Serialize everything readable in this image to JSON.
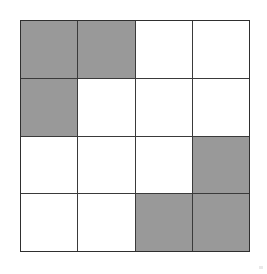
{
  "figure": {
    "rows": 4,
    "columns": 4,
    "fill_color": "#999999",
    "empty_color": "#ffffff",
    "line_color": "#3a3a3a",
    "background_color": "#ffffff"
  },
  "chart_data": {
    "type": "heatmap",
    "xlabel": "",
    "ylabel": "",
    "categories": [
      "1",
      "2",
      "3",
      "4"
    ],
    "row_labels": [
      "1",
      "2",
      "3",
      "4"
    ],
    "legend": [
      {
        "label": "shaded",
        "value": 1,
        "color": "#999999"
      },
      {
        "label": "empty",
        "value": 0,
        "color": "#ffffff"
      }
    ],
    "values": [
      [
        1,
        1,
        0,
        0
      ],
      [
        1,
        0,
        0,
        0
      ],
      [
        0,
        0,
        0,
        1
      ],
      [
        0,
        0,
        1,
        1
      ]
    ],
    "shaded_count": 7,
    "empty_count": 9,
    "grid": true
  },
  "cells": [
    {
      "id": "cell-r1c1",
      "row": 1,
      "col": 1,
      "state": "shaded"
    },
    {
      "id": "cell-r1c2",
      "row": 1,
      "col": 2,
      "state": "shaded"
    },
    {
      "id": "cell-r1c3",
      "row": 1,
      "col": 3,
      "state": "empty"
    },
    {
      "id": "cell-r1c4",
      "row": 1,
      "col": 4,
      "state": "empty"
    },
    {
      "id": "cell-r2c1",
      "row": 2,
      "col": 1,
      "state": "shaded"
    },
    {
      "id": "cell-r2c2",
      "row": 2,
      "col": 2,
      "state": "empty"
    },
    {
      "id": "cell-r2c3",
      "row": 2,
      "col": 3,
      "state": "empty"
    },
    {
      "id": "cell-r2c4",
      "row": 2,
      "col": 4,
      "state": "empty"
    },
    {
      "id": "cell-r3c1",
      "row": 3,
      "col": 1,
      "state": "empty"
    },
    {
      "id": "cell-r3c2",
      "row": 3,
      "col": 2,
      "state": "empty"
    },
    {
      "id": "cell-r3c3",
      "row": 3,
      "col": 3,
      "state": "empty"
    },
    {
      "id": "cell-r3c4",
      "row": 3,
      "col": 4,
      "state": "shaded"
    },
    {
      "id": "cell-r4c1",
      "row": 4,
      "col": 1,
      "state": "empty"
    },
    {
      "id": "cell-r4c2",
      "row": 4,
      "col": 2,
      "state": "empty"
    },
    {
      "id": "cell-r4c3",
      "row": 4,
      "col": 3,
      "state": "shaded"
    },
    {
      "id": "cell-r4c4",
      "row": 4,
      "col": 4,
      "state": "shaded"
    }
  ]
}
